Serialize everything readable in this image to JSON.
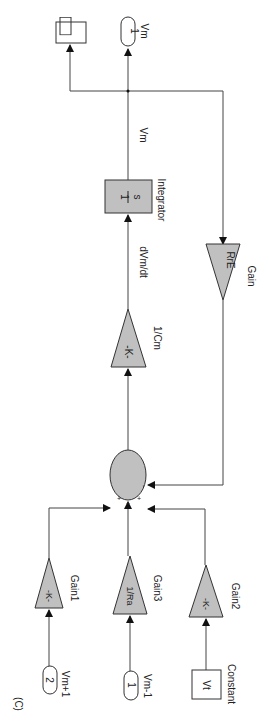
{
  "figure_label": "(C)",
  "blocks": {
    "scope": {
      "label": ""
    },
    "out_vm": {
      "port": "1",
      "label": "Vm"
    },
    "integrator": {
      "num": "1",
      "den": "s",
      "label": "Integrator"
    },
    "gain_rre": {
      "value": "RrE",
      "label": "Gain"
    },
    "gain_cm": {
      "value": "-K-",
      "label": "1/Cm"
    },
    "sum": {
      "signs": [
        "+",
        "+",
        "+",
        "-"
      ]
    },
    "gain1": {
      "value": "-K-",
      "label": "Gain1"
    },
    "gain3": {
      "value": "1/Ra",
      "label": "Gain3"
    },
    "gain2": {
      "value": "-K-",
      "label": "Gain2"
    },
    "in_vm_plus": {
      "port": "2",
      "label": "Vm+1"
    },
    "in_vm_minus": {
      "port": "1",
      "label": "Vm-1"
    },
    "constant": {
      "value": "Vt",
      "label": "Constant"
    }
  },
  "signals": {
    "vm": "Vm",
    "dvm": "dVm/dt"
  }
}
